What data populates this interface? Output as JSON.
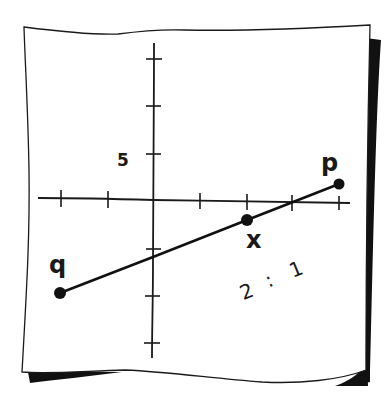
{
  "diagram": {
    "type": "coordinate-plane-section-formula",
    "paper": {
      "fill": "#ffffff",
      "stroke": "#1a1a1a",
      "shadow": "#111111"
    },
    "axes": {
      "y_tick_label": "5",
      "x_ticks_left": 2,
      "x_ticks_right": 4,
      "y_ticks_up": 3,
      "y_ticks_down": 3
    },
    "points": [
      {
        "id": "q",
        "label": "q"
      },
      {
        "id": "x",
        "label": "x"
      },
      {
        "id": "p",
        "label": "p"
      }
    ],
    "segment": {
      "from": "q",
      "to": "p",
      "divided_by": "x"
    },
    "ratio": {
      "text": "2 : 1",
      "left": "2",
      "separator": ":",
      "right": "1"
    }
  }
}
